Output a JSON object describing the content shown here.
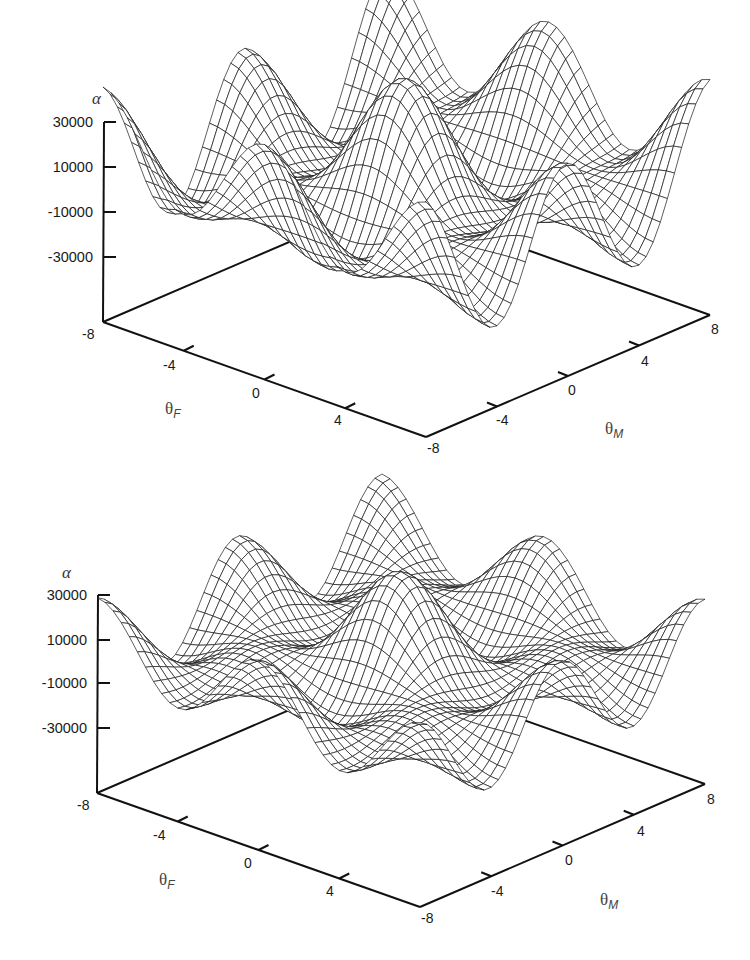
{
  "chart_data": [
    {
      "type": "surface",
      "title": "",
      "panel": "top",
      "xlabel": "θF",
      "ylabel": "θM",
      "zlabel": "α",
      "x_ticks": [
        "-8",
        "-4",
        "0",
        "4",
        "-8"
      ],
      "y_ticks": [
        "-8",
        "-4",
        "0",
        "4",
        "8"
      ],
      "z_ticks": [
        "30000",
        "10000",
        "-10000",
        "-30000"
      ],
      "xlim": [
        -8,
        8
      ],
      "ylim": [
        -8,
        8
      ],
      "zlim": [
        -40000,
        30000
      ],
      "grid": false,
      "style": "black wireframe mesh on white",
      "description": "Oscillatory surface with a central peak near (0,0) reaching ~40000, four surrounding peaks ~30000, and deep troughs ~-35000 along the front; edges rise toward the θM = ±8 corners."
    },
    {
      "type": "surface",
      "title": "",
      "panel": "bottom",
      "xlabel": "θF",
      "ylabel": "θM",
      "zlabel": "α",
      "x_ticks": [
        "-8",
        "-4",
        "0",
        "4",
        "-8"
      ],
      "y_ticks": [
        "-8",
        "-4",
        "0",
        "4",
        "8"
      ],
      "z_ticks": [
        "30000",
        "10000",
        "-10000",
        "-30000"
      ],
      "xlim": [
        -8,
        8
      ],
      "ylim": [
        -8,
        8
      ],
      "zlim": [
        -40000,
        30000
      ],
      "grid": false,
      "style": "black wireframe mesh on white",
      "description": "Similar oscillatory surface with lower amplitude and a flatter, tilted profile; central peak ~35000, side peaks ~20000, troughs ~-30000, edges near 0."
    }
  ],
  "plots": {
    "top": {
      "z_axis_title": "α",
      "z_ticks": [
        "30000",
        "10000",
        "-10000",
        "-30000"
      ],
      "corner_label_left": "-8",
      "f_ticks": [
        "-4",
        "0",
        "4"
      ],
      "f_end_label": "-8",
      "m_ticks": [
        "-4",
        "0",
        "4"
      ],
      "m_end_label": "8",
      "f_title": "θ",
      "f_sub": "F",
      "m_title": "θ",
      "m_sub": "M"
    },
    "bottom": {
      "z_axis_title": "α",
      "z_ticks": [
        "30000",
        "10000",
        "-10000",
        "-30000"
      ],
      "corner_label_left": "-8",
      "f_ticks": [
        "-4",
        "0",
        "4"
      ],
      "f_end_label": "-8",
      "m_ticks": [
        "-4",
        "0",
        "4"
      ],
      "m_end_label": "8",
      "f_title": "θ",
      "f_sub": "F",
      "m_title": "θ",
      "m_sub": "M"
    }
  }
}
